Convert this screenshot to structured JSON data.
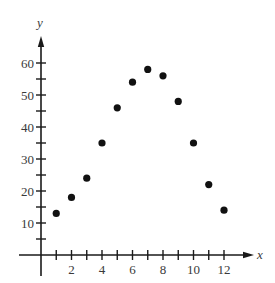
{
  "chart_data": {
    "type": "scatter",
    "title": "",
    "xlabel": "x",
    "ylabel": "y",
    "x": [
      1,
      2,
      3,
      4,
      5,
      6,
      7,
      8,
      9,
      10,
      11,
      12
    ],
    "y": [
      13,
      18,
      24,
      35,
      46,
      54,
      58,
      56,
      48,
      35,
      22,
      14
    ],
    "xlim": [
      -1.4,
      13.7
    ],
    "ylim": [
      -6.5,
      68
    ],
    "x_ticks": [
      1,
      2,
      3,
      4,
      5,
      6,
      7,
      8,
      9,
      10,
      11,
      12
    ],
    "x_tick_labels": [
      "2",
      "4",
      "6",
      "8",
      "10",
      "12"
    ],
    "x_tick_label_values": [
      2,
      4,
      6,
      8,
      10,
      12
    ],
    "y_ticks": [
      5,
      10,
      15,
      20,
      25,
      30,
      35,
      40,
      45,
      50,
      55,
      60
    ],
    "y_tick_labels": [
      "10",
      "20",
      "30",
      "40",
      "50",
      "60"
    ],
    "y_tick_label_values": [
      10,
      20,
      30,
      40,
      50,
      60
    ],
    "grid": false,
    "legend": null,
    "marker_color": "#111111",
    "axis_color": "#1a1a1a"
  }
}
